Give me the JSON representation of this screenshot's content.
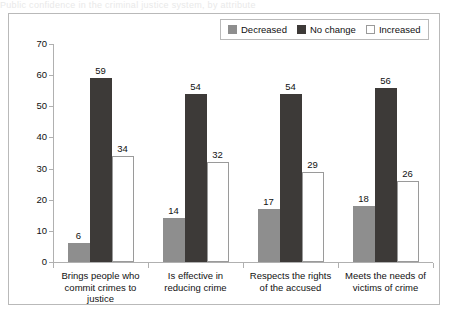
{
  "cut_title": "Public confidence in the criminal justice system, by attribute",
  "legend": {
    "position": "top-right",
    "items": [
      {
        "label": "Decreased",
        "color": "#8e8e8e",
        "key": "decreased"
      },
      {
        "label": "No change",
        "color": "#3d3a38",
        "key": "nochange"
      },
      {
        "label": "Increased",
        "color": "#ffffff",
        "key": "increased"
      }
    ]
  },
  "chart_data": {
    "type": "bar",
    "title": "",
    "xlabel": "",
    "ylabel": "",
    "ylim": [
      0,
      70
    ],
    "yticks": [
      0,
      10,
      20,
      30,
      40,
      50,
      60,
      70
    ],
    "grid": false,
    "legend_position": "top-right",
    "categories": [
      "Brings people who commit crimes to justice",
      "Is effective in reducing crime",
      "Respects the rights of the accused",
      "Meets the needs of victims of crime"
    ],
    "category_lines": [
      [
        "Brings people who",
        "commit crimes to",
        "justice"
      ],
      [
        "Is effective in",
        "reducing crime"
      ],
      [
        "Respects the rights",
        "of the accused"
      ],
      [
        "Meets the needs of",
        "victims of crime"
      ]
    ],
    "series": [
      {
        "name": "Decreased",
        "color": "#8e8e8e",
        "values": [
          6,
          14,
          17,
          18
        ]
      },
      {
        "name": "No change",
        "color": "#3d3a38",
        "values": [
          59,
          54,
          54,
          56
        ]
      },
      {
        "name": "Increased",
        "color": "#ffffff",
        "values": [
          34,
          32,
          29,
          26
        ]
      }
    ]
  }
}
